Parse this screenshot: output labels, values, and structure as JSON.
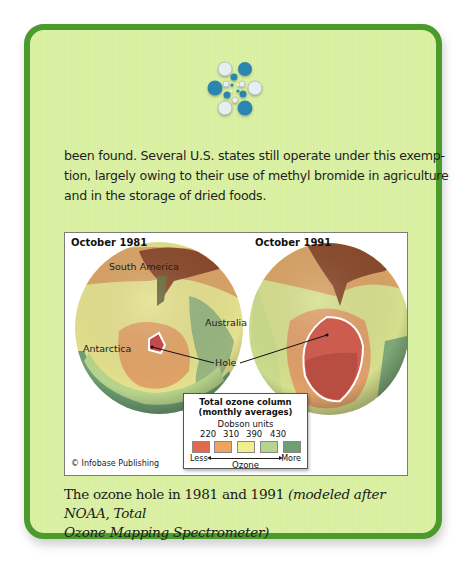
{
  "body_text": {
    "lines": [
      "been found. Several U.S. states still operate under this exemp-",
      "tion, largely owing to their use of methyl bromide in agriculture",
      "and in the storage of dried foods."
    ]
  },
  "figure": {
    "left_panel": {
      "title": "October 1981",
      "labels": {
        "south_america": "South America",
        "australia": "Australia",
        "antarctica": "Antarctica"
      }
    },
    "right_panel": {
      "title": "October 1991"
    },
    "hole_label": "Hole",
    "legend": {
      "title_line1": "Total ozone column",
      "title_line2": "(monthly averages)",
      "units": "Dobson units",
      "ticks": [
        "220",
        "310",
        "390",
        "430"
      ],
      "swatch_colors": [
        "#e2694e",
        "#eea45e",
        "#f2ee8e",
        "#b7d48c",
        "#6e9f74"
      ],
      "less_label": "Less",
      "more_label": "More",
      "axis_label": "Ozone"
    },
    "credit": "© Infobase Publishing"
  },
  "caption": {
    "main": "The ozone hole in 1981 and 1991 ",
    "italic_line1": "(modeled after NOAA, Total",
    "italic_line2": "Ozone Mapping Spectrometer)"
  },
  "colors": {
    "card_bg": "#d8efa0",
    "card_border": "#4a9a2c",
    "logo_dark": "#2a86b0",
    "logo_light": "#e6eef2"
  }
}
